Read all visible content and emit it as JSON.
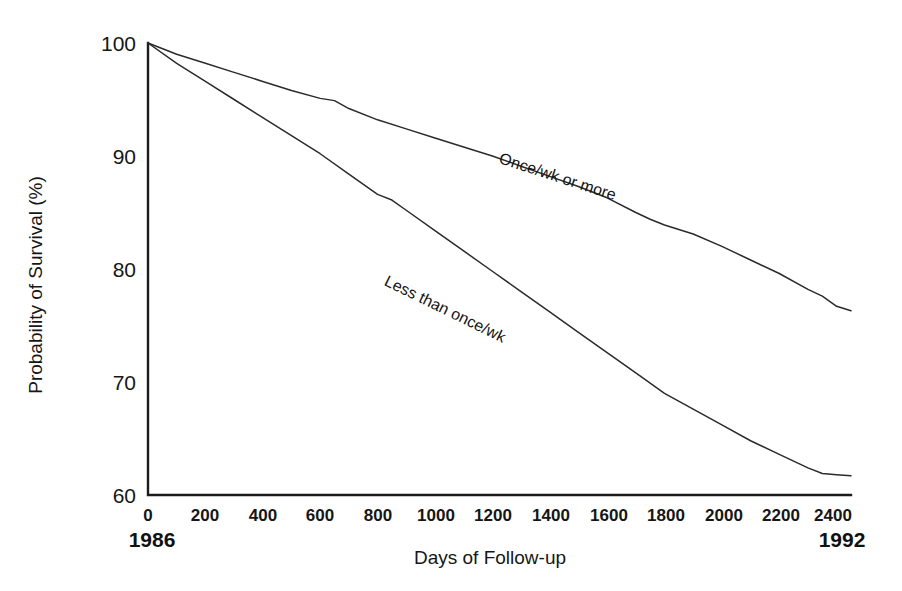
{
  "chart_data": {
    "type": "line",
    "title": "",
    "xlabel": "Days of Follow-up",
    "ylabel": "Probability of Survival (%)",
    "xlim": [
      0,
      2450
    ],
    "ylim": [
      60,
      100
    ],
    "grid": false,
    "legend_position": "inline-curve-labels",
    "xticks": [
      0,
      200,
      400,
      600,
      800,
      1000,
      1200,
      1400,
      1600,
      1800,
      2000,
      2200,
      2400
    ],
    "xticklabels": [
      "0",
      "200",
      "400",
      "600",
      "800",
      "1000",
      "1200",
      "1400",
      "1600",
      "1800",
      "2000",
      "2200",
      "2400"
    ],
    "yticks": [
      60,
      70,
      80,
      90,
      100
    ],
    "yticklabels": [
      "60",
      "70",
      "80",
      "90",
      "100"
    ],
    "x_start_year": "1986",
    "x_end_year": "1992",
    "series": [
      {
        "name": "Once/wk or more",
        "label_x": 1220,
        "label_y": 89.4,
        "label_rotation": 18,
        "x": [
          0,
          100,
          200,
          300,
          400,
          500,
          600,
          650,
          700,
          800,
          900,
          1000,
          1100,
          1200,
          1300,
          1400,
          1500,
          1600,
          1700,
          1750,
          1800,
          1900,
          2000,
          2100,
          2200,
          2300,
          2350,
          2400,
          2450
        ],
        "values": [
          100.0,
          99.0,
          98.2,
          97.4,
          96.6,
          95.8,
          95.1,
          94.9,
          94.2,
          93.2,
          92.4,
          91.6,
          90.8,
          90.0,
          89.1,
          88.2,
          87.3,
          86.3,
          85.0,
          84.4,
          83.9,
          83.1,
          82.0,
          80.8,
          79.6,
          78.2,
          77.6,
          76.7,
          76.3
        ]
      },
      {
        "name": "Less than once/wk",
        "label_x": 820,
        "label_y": 78.6,
        "label_rotation": 26,
        "x": [
          0,
          100,
          200,
          300,
          400,
          500,
          600,
          700,
          800,
          850,
          900,
          1000,
          1100,
          1200,
          1300,
          1400,
          1500,
          1600,
          1700,
          1800,
          1900,
          2000,
          2100,
          2200,
          2300,
          2350,
          2400,
          2450
        ],
        "values": [
          100.0,
          98.2,
          96.6,
          95.0,
          93.4,
          91.8,
          90.2,
          88.4,
          86.6,
          86.1,
          85.2,
          83.4,
          81.6,
          79.8,
          78.0,
          76.2,
          74.4,
          72.6,
          70.8,
          69.0,
          67.6,
          66.2,
          64.8,
          63.6,
          62.4,
          61.9,
          61.8,
          61.7
        ]
      }
    ]
  },
  "figure": {
    "background_color": "#ffffff",
    "axis_color": "#1c1c1c",
    "curve_color": "#2b2b2b",
    "text_color": "#161616"
  }
}
